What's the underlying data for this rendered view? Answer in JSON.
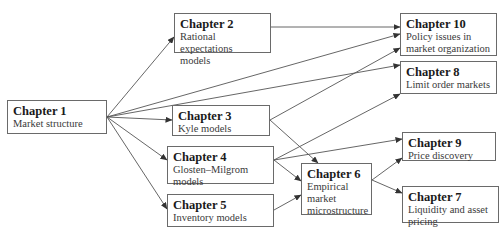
{
  "nodes": {
    "ch1": {
      "title": "Chapter 1",
      "subtitle": "Market structure"
    },
    "ch2": {
      "title": "Chapter 2",
      "subtitle": "Rational expectations models"
    },
    "ch3": {
      "title": "Chapter 3",
      "subtitle": "Kyle models"
    },
    "ch4": {
      "title": "Chapter 4",
      "subtitle": "Glosten–Milgrom models"
    },
    "ch5": {
      "title": "Chapter 5",
      "subtitle": "Inventory models"
    },
    "ch6": {
      "title": "Chapter 6",
      "subtitle": "Empirical market microstructure"
    },
    "ch7": {
      "title": "Chapter 7",
      "subtitle": "Liquidity and asset pricing"
    },
    "ch8": {
      "title": "Chapter 8",
      "subtitle": "Limit order markets"
    },
    "ch9": {
      "title": "Chapter 9",
      "subtitle": "Price discovery"
    },
    "ch10": {
      "title": "Chapter 10",
      "subtitle": "Policy issues in market organization"
    }
  },
  "edges": [
    {
      "from": "ch1",
      "to": "ch2"
    },
    {
      "from": "ch1",
      "to": "ch10"
    },
    {
      "from": "ch1",
      "to": "ch8"
    },
    {
      "from": "ch1",
      "to": "ch3"
    },
    {
      "from": "ch1",
      "to": "ch4"
    },
    {
      "from": "ch1",
      "to": "ch5"
    },
    {
      "from": "ch2",
      "to": "ch10"
    },
    {
      "from": "ch3",
      "to": "ch10"
    },
    {
      "from": "ch3",
      "to": "ch6"
    },
    {
      "from": "ch4",
      "to": "ch8"
    },
    {
      "from": "ch4",
      "to": "ch9"
    },
    {
      "from": "ch4",
      "to": "ch6"
    },
    {
      "from": "ch5",
      "to": "ch6"
    },
    {
      "from": "ch6",
      "to": "ch9"
    },
    {
      "from": "ch6",
      "to": "ch7"
    }
  ],
  "colors": {
    "line": "#555555",
    "border": "#6a6a6a"
  }
}
